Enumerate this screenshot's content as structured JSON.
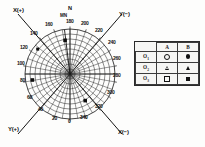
{
  "figure": {
    "type": "polar-stereonet",
    "axis_labels": {
      "top_left": "X(+)",
      "top_right": "Y(−)",
      "bottom_left": "Y(+)",
      "bottom_right": "X(−)"
    },
    "compass": {
      "north": "N",
      "magnetic_north": "MN"
    },
    "degree_ticks": [
      {
        "label": "0",
        "angle": 0
      },
      {
        "label": "20",
        "angle": 20
      },
      {
        "label": "40",
        "angle": 40
      },
      {
        "label": "60",
        "angle": 60
      },
      {
        "label": "80",
        "angle": 80
      },
      {
        "label": "100",
        "angle": 100
      },
      {
        "label": "120",
        "angle": 120
      },
      {
        "label": "140",
        "angle": 140
      },
      {
        "label": "160",
        "angle": 160
      },
      {
        "label": "180",
        "angle": 180
      },
      {
        "label": "200",
        "angle": 200
      },
      {
        "label": "220",
        "angle": 220
      },
      {
        "label": "240",
        "angle": 240
      },
      {
        "label": "260",
        "angle": 260
      },
      {
        "label": "280",
        "angle": 280
      },
      {
        "label": "300",
        "angle": 300
      },
      {
        "label": "320",
        "angle": 320
      },
      {
        "label": "340",
        "angle": 340
      }
    ],
    "data_points": [
      {
        "id": "p1",
        "angle": 196,
        "radius_frac": 0.62,
        "symbol": "filled-square"
      },
      {
        "id": "p2",
        "angle": 106,
        "radius_frac": 0.74,
        "symbol": "filled-square"
      },
      {
        "id": "p3",
        "angle": 78,
        "radius_frac": 0.8,
        "symbol": "filled-square"
      },
      {
        "id": "p4",
        "angle": 312,
        "radius_frac": 0.72,
        "symbol": "filled-square"
      }
    ],
    "grid": {
      "radial_spokes": 18,
      "concentric_rings": 9,
      "spoke_step_deg": 20
    }
  },
  "legend": {
    "column_headers": [
      "",
      "A",
      "B"
    ],
    "rows": [
      {
        "label": "O",
        "sub": "1",
        "a_symbol": "open-circle",
        "b_symbol": "filled-circle"
      },
      {
        "label": "O",
        "sub": "2",
        "a_symbol": "open-triangle",
        "b_symbol": "filled-triangle"
      },
      {
        "label": "O",
        "sub": "3",
        "a_symbol": "open-square",
        "b_symbol": "filled-square"
      }
    ]
  },
  "colors": {
    "ink": "#111111",
    "grid": "#2e2e2e",
    "paper": "#fdfdfc",
    "legend_bg": "#f6f6f4"
  }
}
